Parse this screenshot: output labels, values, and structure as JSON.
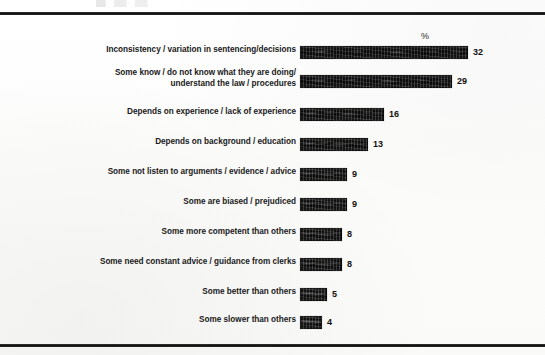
{
  "chart_data": {
    "type": "bar",
    "orientation": "horizontal",
    "title": "",
    "subtitle": "",
    "xlabel": "",
    "ylabel": "",
    "value_axis_header": "%",
    "grid": false,
    "legend": null,
    "xlim": [
      0,
      35
    ],
    "categories": [
      "Inconsistency / variation in sentencing/decisions",
      "Some know / do not know what they are doing/\nunderstand the law / procedures",
      "Depends on experience / lack of experience",
      "Depends on background / education",
      "Some not listen to arguments / evidence / advice",
      "Some are biased / prejudiced",
      "Some more competent than others",
      "Some need constant advice / guidance from clerks",
      "Some better than others",
      "Some slower than others"
    ],
    "values": [
      32,
      29,
      16,
      13,
      9,
      9,
      8,
      8,
      5,
      4
    ],
    "value_labels": [
      "32",
      "29",
      "16",
      "13",
      "9",
      "9",
      "8",
      "8",
      "5",
      "4"
    ],
    "bar_color": "#111111",
    "background_color": "#ffffff",
    "rows": [
      {
        "label": "Inconsistency / variation in sentencing/decisions",
        "value": 32,
        "value_label": "32",
        "top": 46,
        "label_top": 45,
        "bar_px": 168,
        "lines": 1
      },
      {
        "label": "Some know / do not know what they are doing/\nunderstand the law / procedures",
        "value": 29,
        "value_label": "29",
        "top": 75,
        "label_top": 68,
        "bar_px": 152,
        "lines": 2
      },
      {
        "label": "Depends on experience / lack of experience",
        "value": 16,
        "value_label": "16",
        "top": 108,
        "label_top": 107,
        "bar_px": 84,
        "lines": 1
      },
      {
        "label": "Depends on background / education",
        "value": 13,
        "value_label": "13",
        "top": 138,
        "label_top": 137,
        "bar_px": 68,
        "lines": 1
      },
      {
        "label": "Some not listen to arguments / evidence / advice",
        "value": 9,
        "value_label": "9",
        "top": 168,
        "label_top": 167,
        "bar_px": 47,
        "lines": 1
      },
      {
        "label": "Some are biased / prejudiced",
        "value": 9,
        "value_label": "9",
        "top": 198,
        "label_top": 197,
        "bar_px": 47,
        "lines": 1
      },
      {
        "label": "Some more competent than others",
        "value": 8,
        "value_label": "8",
        "top": 228,
        "label_top": 227,
        "bar_px": 42,
        "lines": 1
      },
      {
        "label": "Some need constant advice / guidance from clerks",
        "value": 8,
        "value_label": "8",
        "top": 258,
        "label_top": 257,
        "bar_px": 42,
        "lines": 1
      },
      {
        "label": "Some better than others",
        "value": 5,
        "value_label": "5",
        "top": 288,
        "label_top": 287,
        "bar_px": 27,
        "lines": 1
      },
      {
        "label": "Some slower than others",
        "value": 4,
        "value_label": "4",
        "top": 316,
        "label_top": 315,
        "bar_px": 22,
        "lines": 1
      }
    ]
  }
}
